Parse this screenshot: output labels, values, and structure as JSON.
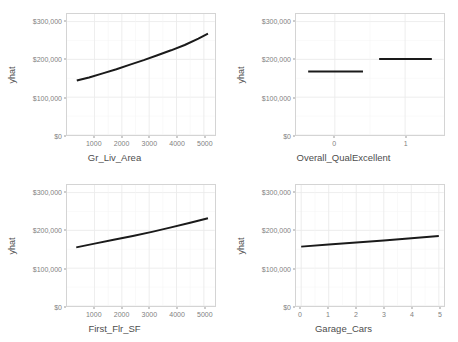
{
  "figure": {
    "type": "facet-grid",
    "rows": 2,
    "columns": 2,
    "background": "#ffffff",
    "line_color": "#1a1a1a",
    "grid_color": "#ebebeb",
    "panel_border_color": "#d4d4d4"
  },
  "chart_data": [
    {
      "type": "line",
      "title": "",
      "xlabel": "Gr_Liv_Area",
      "ylabel": "yhat",
      "xlim": [
        0,
        5400
      ],
      "ylim": [
        0,
        320000
      ],
      "xticks": [
        1000,
        2000,
        3000,
        4000,
        5000
      ],
      "xticklabels": [
        "1000",
        "2000",
        "3000",
        "4000",
        "5000"
      ],
      "yticks": [
        0,
        100000,
        200000,
        300000
      ],
      "yticklabels": [
        "$0",
        "$100,000",
        "$200,000",
        "$300,000"
      ],
      "grid": true,
      "legend": "none",
      "x": [
        350,
        800,
        1300,
        1800,
        2300,
        2800,
        3300,
        3800,
        4300,
        4800,
        5150
      ],
      "y": [
        144000,
        152000,
        163000,
        174000,
        186000,
        198000,
        211000,
        224000,
        238000,
        255000,
        268000
      ]
    },
    {
      "type": "line",
      "title": "",
      "xlabel": "Overall_QualExcellent",
      "ylabel": "yhat",
      "xlim": [
        -0.55,
        1.55
      ],
      "ylim": [
        0,
        320000
      ],
      "xticks": [
        0,
        1
      ],
      "xticklabels": [
        "0",
        "1"
      ],
      "yticks": [
        0,
        100000,
        200000,
        300000
      ],
      "yticklabels": [
        "$0",
        "$100,000",
        "$200,000",
        "$300,000"
      ],
      "grid": true,
      "legend": "none",
      "segments": [
        {
          "x_start": -0.38,
          "x_end": 0.4,
          "y": 168000
        },
        {
          "x_start": 0.63,
          "x_end": 1.38,
          "y": 201000
        }
      ]
    },
    {
      "type": "line",
      "title": "",
      "xlabel": "First_Flr_SF",
      "ylabel": "yhat",
      "xlim": [
        0,
        5400
      ],
      "ylim": [
        0,
        320000
      ],
      "xticks": [
        1000,
        2000,
        3000,
        4000,
        5000
      ],
      "xticklabels": [
        "1000",
        "2000",
        "3000",
        "4000",
        "5000"
      ],
      "yticks": [
        0,
        100000,
        200000,
        300000
      ],
      "yticklabels": [
        "$0",
        "$100,000",
        "$200,000",
        "$300,000"
      ],
      "grid": true,
      "legend": "none",
      "x": [
        330,
        1000,
        1700,
        2400,
        3100,
        3800,
        4500,
        5150
      ],
      "y": [
        155000,
        165000,
        175000,
        185000,
        196000,
        208000,
        220000,
        232000
      ]
    },
    {
      "type": "line",
      "title": "",
      "xlabel": "Garage_Cars",
      "ylabel": "yhat",
      "xlim": [
        -0.18,
        5.18
      ],
      "ylim": [
        0,
        320000
      ],
      "xticks": [
        0,
        1,
        2,
        3,
        4,
        5
      ],
      "xticklabels": [
        "0",
        "1",
        "2",
        "3",
        "4",
        "5"
      ],
      "yticks": [
        0,
        100000,
        200000,
        300000
      ],
      "yticklabels": [
        "$0",
        "$100,000",
        "$200,000",
        "$300,000"
      ],
      "grid": true,
      "legend": "none",
      "x": [
        0,
        1,
        2,
        3,
        4,
        5
      ],
      "y": [
        157000,
        162500,
        168000,
        173500,
        179000,
        185000
      ]
    }
  ]
}
